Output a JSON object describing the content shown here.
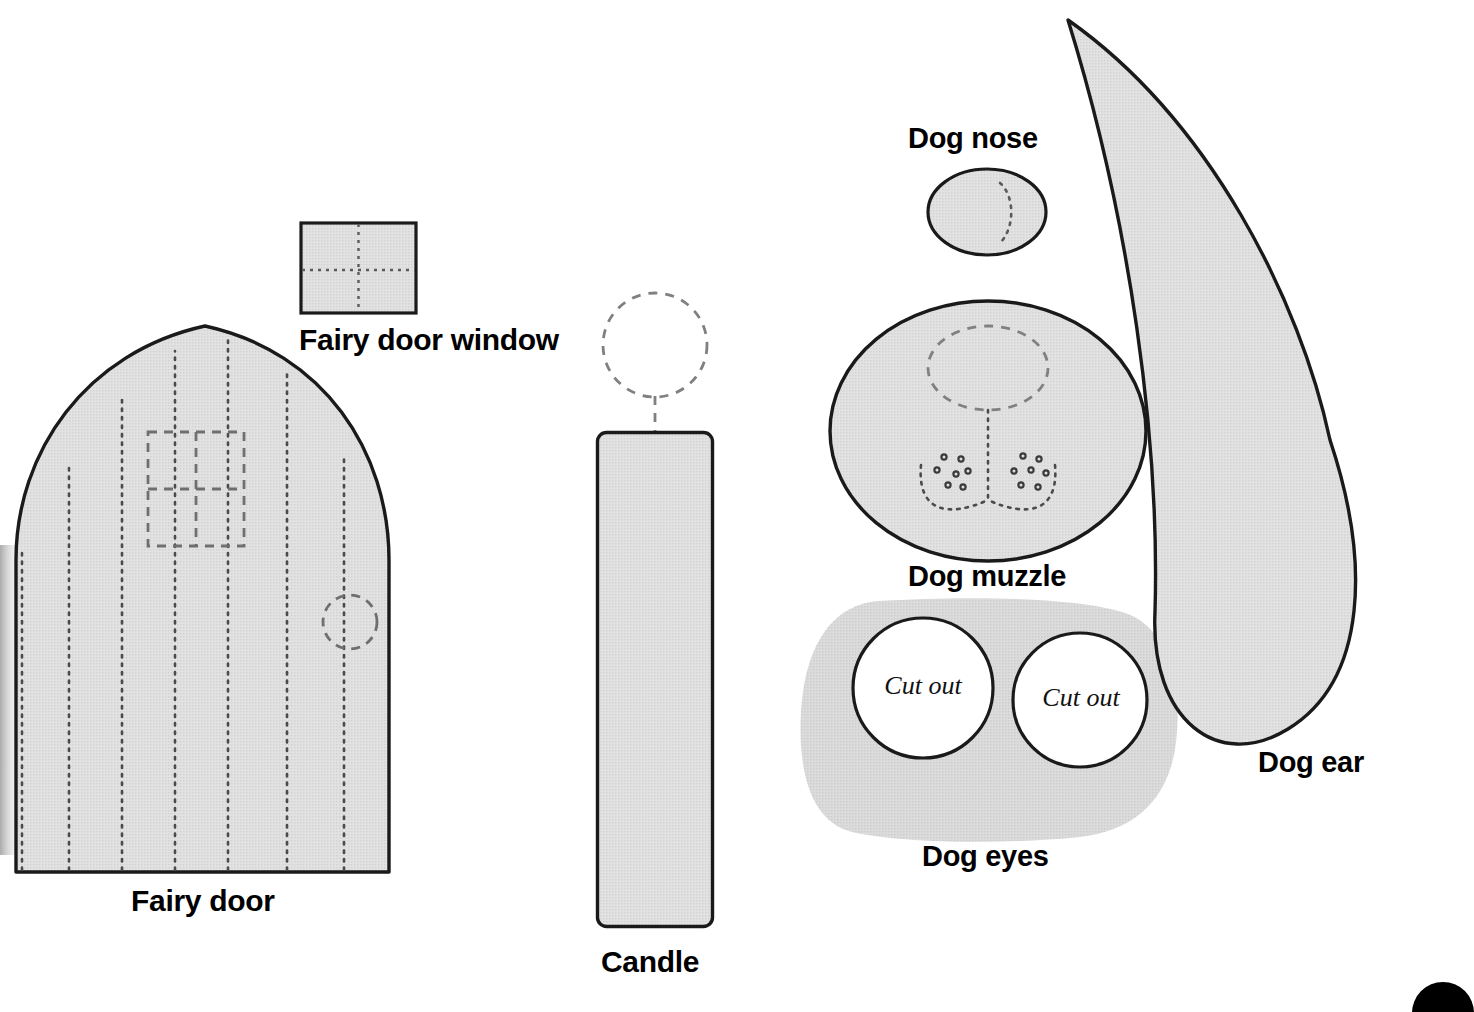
{
  "sheet": {
    "background": "#ffffff",
    "fill_gray": "#dedede",
    "blob_gray": "#d8d8d8",
    "outline": "#1a1a1a",
    "dash_gray": "#7d7d7d",
    "dot_gray": "#5a5a5a"
  },
  "labels": {
    "fairy_door_window": "Fairy door window",
    "fairy_door": "Fairy door",
    "candle": "Candle",
    "dog_nose": "Dog nose",
    "dog_muzzle": "Dog muzzle",
    "dog_eyes": "Dog eyes",
    "dog_ear": "Dog ear"
  },
  "cutouts": {
    "left_eye": "Cut out",
    "right_eye": "Cut out"
  },
  "pieces": [
    {
      "name": "fairy-door-window",
      "label": "Fairy door window",
      "shape": "square",
      "fill": "#dedede",
      "stroke": "#1a1a1a",
      "markings": [
        "dotted vertical center line",
        "dotted horizontal center line"
      ],
      "bounds": {
        "x": 300,
        "y": 222,
        "width": 117,
        "height": 92
      },
      "label_pos": {
        "x": 299,
        "y": 329
      }
    },
    {
      "name": "fairy-door",
      "label": "Fairy door",
      "shape": "arched-door",
      "fill": "#dedede",
      "stroke": "#1a1a1a",
      "markings": [
        "seven dotted vertical plank lines",
        "dashed four-pane window",
        "dashed door knob circle"
      ],
      "bounds": {
        "x": 12,
        "y": 325,
        "width": 382,
        "height": 547
      },
      "label_pos": {
        "x": 131,
        "y": 889
      }
    },
    {
      "name": "candle",
      "label": "Candle",
      "shape": "rounded-rectangle",
      "fill": "#dedede",
      "stroke": "#1a1a1a",
      "markings": [
        "dashed flame circle",
        "dashed wick line"
      ],
      "bounds": {
        "x": 596,
        "y": 431,
        "width": 118,
        "height": 497
      },
      "label_pos": {
        "x": 601,
        "y": 950
      }
    },
    {
      "name": "dog-nose",
      "label": "Dog nose",
      "shape": "ellipse",
      "fill": "#dedede",
      "stroke": "#1a1a1a",
      "markings": [
        "small dotted arc highlight"
      ],
      "bounds": {
        "x": 927,
        "y": 168,
        "width": 120,
        "height": 88
      },
      "label_pos": {
        "x": 907,
        "y": 126
      }
    },
    {
      "name": "dog-muzzle",
      "label": "Dog muzzle",
      "shape": "ellipse",
      "fill": "#dedede",
      "stroke": "#1a1a1a",
      "markings": [
        "dashed nose placement ellipse",
        "dotted vertical center line",
        "two dotted mouth arcs",
        "five whisker dots per side"
      ],
      "bounds": {
        "x": 828,
        "y": 300,
        "width": 320,
        "height": 262
      },
      "label_pos": {
        "x": 907,
        "y": 563
      }
    },
    {
      "name": "dog-eyes",
      "label": "Dog eyes",
      "shape": "rounded-blob",
      "fill": "#d8d8d8",
      "stroke": "none",
      "markings": [
        "two white cut-out circles with black outline"
      ],
      "bounds": {
        "x": 800,
        "y": 598,
        "width": 378,
        "height": 245
      },
      "label_pos": {
        "x": 921,
        "y": 844
      },
      "eyes": [
        {
          "cx": 923,
          "cy": 688,
          "r": 70,
          "label": "Cut out"
        },
        {
          "cx": 1080,
          "cy": 700,
          "r": 67,
          "label": "Cut out"
        }
      ]
    },
    {
      "name": "dog-ear",
      "label": "Dog ear",
      "shape": "teardrop",
      "fill": "#dedede",
      "stroke": "#1a1a1a",
      "markings": [],
      "bounds": {
        "x": 1065,
        "y": 18,
        "width": 335,
        "height": 722
      },
      "label_pos": {
        "x": 1258,
        "y": 749
      }
    },
    {
      "name": "corner-dot",
      "label": "",
      "shape": "circle",
      "fill": "#000000",
      "stroke": "none",
      "markings": [],
      "bounds": {
        "x": 1412,
        "y": 982,
        "width": 62,
        "height": 62
      },
      "label_pos": null
    }
  ]
}
